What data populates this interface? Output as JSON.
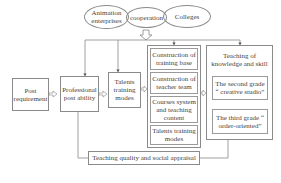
{
  "cooperation": {
    "left": "Animation enterprises",
    "center": "cooperation",
    "right": "Colleges"
  },
  "flow": {
    "post_requirement": "Post requirement",
    "professional_post_ability": "Professional post ability",
    "talents_training_modes": "Talents training modes"
  },
  "middle_column": {
    "items": [
      "Construction of training base",
      "Construction of teacher team",
      "Courses system and teaching content",
      "Talents training modes"
    ]
  },
  "right_column": {
    "title": "Teaching of knowledge and skill",
    "items": [
      "The second grade “ creative studio”",
      "The third grade “ order-oriented”"
    ]
  },
  "feedback": {
    "label": "Teaching quality and social appraisal"
  }
}
